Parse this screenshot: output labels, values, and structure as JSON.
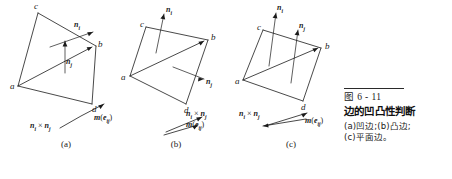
{
  "figure": {
    "number": "图 6 - 11",
    "title": "边的凹凸性判断",
    "subcaption_line1": "(a)凹边;(b)凸边;",
    "subcaption_line2": "(c)平面边。",
    "ink_color": "#1a1a1a"
  },
  "panels": [
    {
      "id": "a",
      "caption": "(a)",
      "type": "concave-edge",
      "vertices": {
        "a": "a",
        "b": "b",
        "c": "c",
        "d": "d"
      },
      "normals": {
        "ni": "n",
        "ni_sub": "i",
        "nj": "n",
        "nj_sub": "j"
      },
      "cross_label": {
        "lead": "n",
        "lead_sub": "i",
        "op": "×",
        "tail": "n",
        "tail_sub": "j"
      },
      "m_label": {
        "m": "m",
        "open": "(",
        "e": "e",
        "e_sub": "ij",
        "close": ")"
      }
    },
    {
      "id": "b",
      "caption": "(b)",
      "type": "convex-edge",
      "vertices": {
        "a": "a",
        "b": "b",
        "c": "c",
        "d": "d"
      },
      "normals": {
        "ni": "n",
        "ni_sub": "i",
        "nj": "n",
        "nj_sub": "j"
      },
      "cross_label": {
        "lead": "n",
        "lead_sub": "i",
        "op": "×",
        "tail": "n",
        "tail_sub": "j"
      },
      "m_label": {
        "m": "m",
        "open": "(",
        "e": "e",
        "e_sub": "ij",
        "close": ")"
      }
    },
    {
      "id": "c",
      "caption": "(c)",
      "type": "planar-edge",
      "vertices": {
        "a": "a",
        "b": "b",
        "c": "c",
        "d": "d"
      },
      "normals": {
        "ni": "n",
        "ni_sub": "i",
        "nj": "n",
        "nj_sub": "j"
      },
      "cross_label": {
        "lead": "n",
        "lead_sub": "i",
        "op": "×",
        "tail": "n",
        "tail_sub": "j"
      },
      "m_label": {
        "m": "m",
        "open": "(",
        "e": "e",
        "e_sub": "ij",
        "close": ")"
      }
    }
  ]
}
